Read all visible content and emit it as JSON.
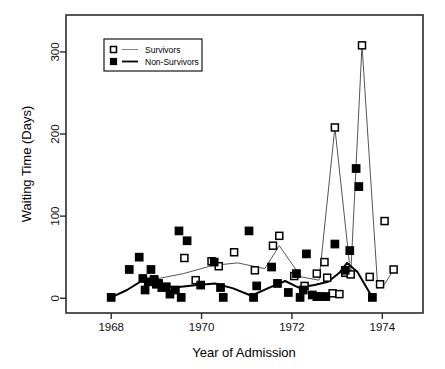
{
  "chart_data": {
    "type": "scatter",
    "title": "",
    "xlabel": "Year of Admission",
    "ylabel": "Waiting Time (Days)",
    "xlim": [
      1967.0,
      1974.9
    ],
    "ylim": [
      -18,
      345
    ],
    "xticks": [
      1968,
      1970,
      1972,
      1974
    ],
    "xticklabels": [
      "1968",
      "1970",
      "1972",
      "1974"
    ],
    "yticks": [
      0,
      100,
      200,
      300
    ],
    "yticklabels": [
      "0",
      "100",
      "200",
      "300"
    ],
    "grid": false,
    "legend_position": "upper-left-inside",
    "series": [
      {
        "name": "Survivors",
        "marker": "open-square",
        "color": "#000000",
        "line_color": "#555555",
        "points": [
          {
            "x": 1968.95,
            "y": 23
          },
          {
            "x": 1969.62,
            "y": 49
          },
          {
            "x": 1969.87,
            "y": 22
          },
          {
            "x": 1970.22,
            "y": 45
          },
          {
            "x": 1970.38,
            "y": 39
          },
          {
            "x": 1970.72,
            "y": 56
          },
          {
            "x": 1971.18,
            "y": 34
          },
          {
            "x": 1971.58,
            "y": 64
          },
          {
            "x": 1971.72,
            "y": 76
          },
          {
            "x": 1972.05,
            "y": 27
          },
          {
            "x": 1972.28,
            "y": 15
          },
          {
            "x": 1972.55,
            "y": 30
          },
          {
            "x": 1972.72,
            "y": 44
          },
          {
            "x": 1972.78,
            "y": 25
          },
          {
            "x": 1972.9,
            "y": 6
          },
          {
            "x": 1972.95,
            "y": 208
          },
          {
            "x": 1973.05,
            "y": 5
          },
          {
            "x": 1973.18,
            "y": 31
          },
          {
            "x": 1973.3,
            "y": 29
          },
          {
            "x": 1973.55,
            "y": 308
          },
          {
            "x": 1973.72,
            "y": 26
          },
          {
            "x": 1973.95,
            "y": 17
          },
          {
            "x": 1974.05,
            "y": 94
          },
          {
            "x": 1974.25,
            "y": 35
          }
        ],
        "smooth_line": [
          {
            "x": 1968.95,
            "y": 23
          },
          {
            "x": 1969.6,
            "y": 30
          },
          {
            "x": 1970.25,
            "y": 40
          },
          {
            "x": 1970.8,
            "y": 43
          },
          {
            "x": 1971.4,
            "y": 36
          },
          {
            "x": 1971.72,
            "y": 64
          },
          {
            "x": 1972.2,
            "y": 26
          },
          {
            "x": 1972.6,
            "y": 22
          },
          {
            "x": 1972.95,
            "y": 208
          },
          {
            "x": 1973.3,
            "y": 28
          },
          {
            "x": 1973.55,
            "y": 308
          },
          {
            "x": 1973.9,
            "y": 12
          },
          {
            "x": 1974.05,
            "y": 17
          },
          {
            "x": 1974.25,
            "y": 35
          }
        ]
      },
      {
        "name": "Non-Survivors",
        "marker": "filled-square",
        "color": "#000000",
        "line_color": "#000000",
        "points": [
          {
            "x": 1968.0,
            "y": 1
          },
          {
            "x": 1968.4,
            "y": 35
          },
          {
            "x": 1968.62,
            "y": 50
          },
          {
            "x": 1968.7,
            "y": 24
          },
          {
            "x": 1968.75,
            "y": 10
          },
          {
            "x": 1968.82,
            "y": 20
          },
          {
            "x": 1968.88,
            "y": 35
          },
          {
            "x": 1968.95,
            "y": 22
          },
          {
            "x": 1969.0,
            "y": 17
          },
          {
            "x": 1969.05,
            "y": 18
          },
          {
            "x": 1969.12,
            "y": 13
          },
          {
            "x": 1969.22,
            "y": 14
          },
          {
            "x": 1969.3,
            "y": 5
          },
          {
            "x": 1969.42,
            "y": 10
          },
          {
            "x": 1969.5,
            "y": 82
          },
          {
            "x": 1969.55,
            "y": 1
          },
          {
            "x": 1969.68,
            "y": 70
          },
          {
            "x": 1969.98,
            "y": 16
          },
          {
            "x": 1970.28,
            "y": 44
          },
          {
            "x": 1970.42,
            "y": 13
          },
          {
            "x": 1970.48,
            "y": 1
          },
          {
            "x": 1971.05,
            "y": 82
          },
          {
            "x": 1971.15,
            "y": 1
          },
          {
            "x": 1971.22,
            "y": 15
          },
          {
            "x": 1971.55,
            "y": 38
          },
          {
            "x": 1971.68,
            "y": 18
          },
          {
            "x": 1971.92,
            "y": 7
          },
          {
            "x": 1972.1,
            "y": 30
          },
          {
            "x": 1972.18,
            "y": 1
          },
          {
            "x": 1972.25,
            "y": 10
          },
          {
            "x": 1972.32,
            "y": 54
          },
          {
            "x": 1972.45,
            "y": 4
          },
          {
            "x": 1972.55,
            "y": 2
          },
          {
            "x": 1972.62,
            "y": 2
          },
          {
            "x": 1972.75,
            "y": 2
          },
          {
            "x": 1972.95,
            "y": 66
          },
          {
            "x": 1973.18,
            "y": 34
          },
          {
            "x": 1973.28,
            "y": 58
          },
          {
            "x": 1973.42,
            "y": 158
          },
          {
            "x": 1973.48,
            "y": 136
          },
          {
            "x": 1973.78,
            "y": 1
          }
        ],
        "smooth_line": [
          {
            "x": 1968.0,
            "y": 1
          },
          {
            "x": 1968.35,
            "y": 10
          },
          {
            "x": 1968.7,
            "y": 22
          },
          {
            "x": 1969.05,
            "y": 17
          },
          {
            "x": 1969.4,
            "y": 13
          },
          {
            "x": 1969.9,
            "y": 16
          },
          {
            "x": 1970.3,
            "y": 18
          },
          {
            "x": 1970.7,
            "y": 12
          },
          {
            "x": 1971.1,
            "y": 3
          },
          {
            "x": 1971.5,
            "y": 13
          },
          {
            "x": 1971.85,
            "y": 21
          },
          {
            "x": 1972.15,
            "y": 13
          },
          {
            "x": 1972.5,
            "y": 16
          },
          {
            "x": 1972.8,
            "y": 20
          },
          {
            "x": 1973.05,
            "y": 31
          },
          {
            "x": 1973.22,
            "y": 43
          },
          {
            "x": 1973.45,
            "y": 32
          },
          {
            "x": 1973.78,
            "y": 1
          }
        ]
      }
    ]
  },
  "legend": {
    "entries": [
      {
        "label": "Survivors",
        "marker": "open-square"
      },
      {
        "label": "Non-Survivors",
        "marker": "filled-square"
      }
    ]
  },
  "axes": {
    "x_title": "Year of Admission",
    "y_title": "Waiting Time (Days)"
  }
}
